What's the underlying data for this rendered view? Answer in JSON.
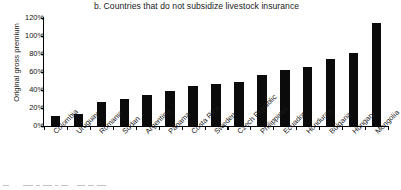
{
  "chart_data": {
    "type": "bar",
    "title": "b. Countries that do not subsidize livestock insurance",
    "xlabel": "",
    "ylabel": "Original gross premium",
    "ylim": [
      0,
      120
    ],
    "ytick_step": 20,
    "ytick_labels": [
      "0%",
      "20%",
      "40%",
      "60%",
      "80%",
      "100%",
      "120%"
    ],
    "ytick_values": [
      0,
      20,
      40,
      60,
      80,
      100,
      120
    ],
    "grid": false,
    "legend": "none",
    "bar_color": "#0b0b0b",
    "categories": [
      "Colombia",
      "Uruguay",
      "Romania",
      "Sudan",
      "Argentina",
      "Panama",
      "Costa Rica",
      "Sweden",
      "Czech Republic",
      "Philippines",
      "Ecuador",
      "Honduras",
      "Bulgaria",
      "Hungary",
      "Mongolia"
    ],
    "values": [
      11,
      13,
      27,
      30,
      35,
      39,
      44,
      47,
      49,
      57,
      62,
      66,
      74,
      81,
      115
    ]
  }
}
